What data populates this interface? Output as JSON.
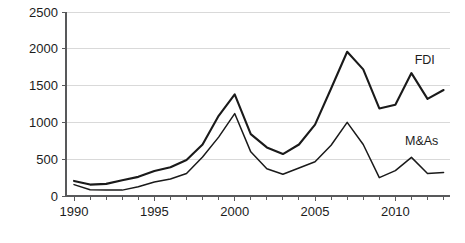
{
  "chart_data": {
    "type": "line",
    "title": "",
    "subtitle": "",
    "xlabel": "",
    "ylabel": "",
    "xlim": [
      1989.5,
      2013.4
    ],
    "ylim": [
      0,
      2500
    ],
    "grid": true,
    "legend_position": "inline-right",
    "x": [
      1990,
      1991,
      1992,
      1993,
      1994,
      1995,
      1996,
      1997,
      1998,
      1999,
      2000,
      2001,
      2002,
      2003,
      2004,
      2005,
      2006,
      2007,
      2008,
      2009,
      2010,
      2011,
      2012,
      2013
    ],
    "series": [
      {
        "name": "FDI",
        "label": "FDI",
        "color": "#1a1a1a",
        "values": [
          205,
          155,
          165,
          215,
          260,
          340,
          390,
          490,
          700,
          1090,
          1380,
          840,
          660,
          570,
          700,
          970,
          1460,
          1960,
          1720,
          1190,
          1240,
          1670,
          1320,
          1440
        ]
      },
      {
        "name": "M&As",
        "label": "M&As",
        "color": "#1a1a1a",
        "values": [
          155,
          85,
          80,
          80,
          125,
          190,
          230,
          305,
          530,
          800,
          1120,
          600,
          370,
          295,
          380,
          465,
          690,
          1000,
          700,
          250,
          345,
          525,
          305,
          320
        ]
      }
    ],
    "y_ticks": [
      0,
      500,
      1000,
      1500,
      2000,
      2500
    ],
    "y_tick_labels": [
      "0",
      "500",
      "1000",
      "1500",
      "2000",
      "2500"
    ],
    "x_major_ticks": [
      1990,
      1995,
      2000,
      2005,
      2010
    ],
    "x_major_tick_labels": [
      "1990",
      "1995",
      "2000",
      "2005",
      "2010"
    ],
    "x_minor_ticks": [
      1991,
      1992,
      1993,
      1994,
      1996,
      1997,
      1998,
      1999,
      2001,
      2002,
      2003,
      2004,
      2006,
      2007,
      2008,
      2009,
      2011,
      2012,
      2013
    ],
    "annotations": [
      {
        "text": "FDI",
        "x": 2011.2,
        "y": 1790
      },
      {
        "text": "M&As",
        "x": 2010.6,
        "y": 690
      }
    ],
    "colors": {
      "line": "#1a1a1a",
      "grid": "#d9d9d9",
      "axis": "#58595b",
      "text": "#1c1c1c",
      "background": "#ffffff"
    }
  }
}
